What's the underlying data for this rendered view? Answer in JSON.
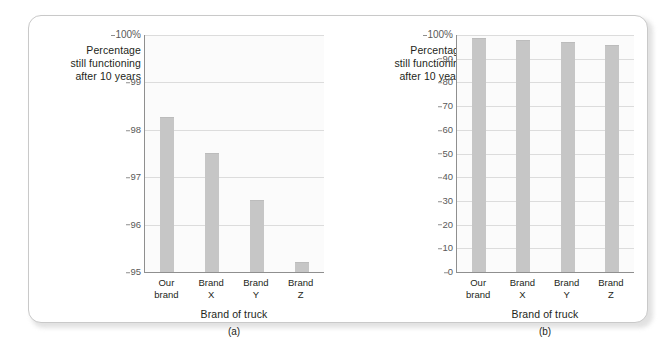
{
  "figure": {
    "background_color": "#ffffff",
    "panel_border_color": "#c9c9c9",
    "bar_color": "#c6c6c6",
    "gridline_color": "#dcdcdc",
    "axis_color": "#8f8f8f"
  },
  "chart_data": [
    {
      "type": "bar",
      "panel_label": "(a)",
      "title": "",
      "ylabel": "Percentage\nstill functioning\nafter 10 years",
      "ylabel_lines": [
        "Percentage",
        "still functioning",
        "after 10 years"
      ],
      "xlabel": "Brand of truck",
      "categories": [
        "Our\nbrand",
        "Brand\nX",
        "Brand\nY",
        "Brand\nZ"
      ],
      "category_lines": [
        [
          "Our",
          "brand"
        ],
        [
          "Brand",
          "X"
        ],
        [
          "Brand",
          "Y"
        ],
        [
          "Brand",
          "Z"
        ]
      ],
      "values": [
        98.25,
        97.5,
        96.5,
        95.2
      ],
      "ylim": [
        95,
        100
      ],
      "yticks": [
        95,
        96,
        97,
        98,
        99,
        100
      ],
      "ytick_labels": [
        "95",
        "96",
        "97",
        "98",
        "99",
        "100%"
      ],
      "grid": true,
      "legend": "none"
    },
    {
      "type": "bar",
      "panel_label": "(b)",
      "title": "",
      "ylabel": "Percentage\nstill functioning\nafter 10 years",
      "ylabel_lines": [
        "Percentage",
        "still functioning",
        "after 10 years"
      ],
      "xlabel": "Brand of truck",
      "categories": [
        "Our\nbrand",
        "Brand\nX",
        "Brand\nY",
        "Brand\nZ"
      ],
      "category_lines": [
        [
          "Our",
          "brand"
        ],
        [
          "Brand",
          "X"
        ],
        [
          "Brand",
          "Y"
        ],
        [
          "Brand",
          "Z"
        ]
      ],
      "values": [
        98.25,
        97.5,
        96.5,
        95.2
      ],
      "ylim": [
        0,
        100
      ],
      "yticks": [
        0,
        10,
        20,
        30,
        40,
        50,
        60,
        70,
        80,
        90,
        100
      ],
      "ytick_labels": [
        "0",
        "10",
        "20",
        "30",
        "40",
        "50",
        "60",
        "70",
        "80",
        "90",
        "100%"
      ],
      "grid": true,
      "legend": "none"
    }
  ]
}
